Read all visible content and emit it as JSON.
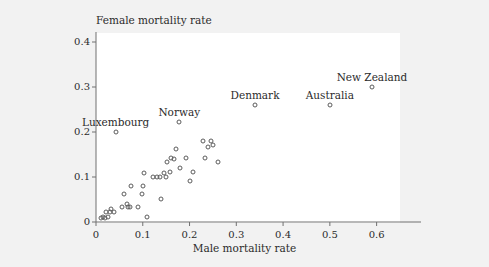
{
  "chart_data": {
    "type": "scatter",
    "title": "",
    "xlabel": "Male mortality rate",
    "ylabel": "Female mortality rate",
    "xlim": [
      0,
      0.65
    ],
    "ylim": [
      0,
      0.42
    ],
    "xticks": [
      "0",
      "0.1",
      "0.2",
      "0.3",
      "0.4",
      "0.5",
      "0.6"
    ],
    "xtick_values": [
      0,
      0.1,
      0.2,
      0.3,
      0.4,
      0.5,
      0.6
    ],
    "yticks": [
      "0",
      "0.1",
      "0.2",
      "0.3",
      "0.4"
    ],
    "ytick_values": [
      0,
      0.1,
      0.2,
      0.3,
      0.4
    ],
    "grid": false,
    "legend": null,
    "marker": "open-circle",
    "marker_color": "#5c5c5c",
    "panel_color": "#ffffff",
    "figure_color": "#f2f2f2",
    "points": [
      {
        "x": 0.01,
        "y": 0.01,
        "label": null
      },
      {
        "x": 0.015,
        "y": 0.012,
        "label": null
      },
      {
        "x": 0.02,
        "y": 0.01,
        "label": null
      },
      {
        "x": 0.022,
        "y": 0.022,
        "label": null
      },
      {
        "x": 0.026,
        "y": 0.012,
        "label": null
      },
      {
        "x": 0.03,
        "y": 0.022,
        "label": null
      },
      {
        "x": 0.032,
        "y": 0.03,
        "label": null
      },
      {
        "x": 0.038,
        "y": 0.022,
        "label": null
      },
      {
        "x": 0.042,
        "y": 0.2,
        "label": "Luxembourg"
      },
      {
        "x": 0.055,
        "y": 0.034,
        "label": null
      },
      {
        "x": 0.06,
        "y": 0.062,
        "label": null
      },
      {
        "x": 0.066,
        "y": 0.04,
        "label": null
      },
      {
        "x": 0.068,
        "y": 0.034,
        "label": null
      },
      {
        "x": 0.072,
        "y": 0.034,
        "label": null
      },
      {
        "x": 0.075,
        "y": 0.08,
        "label": null
      },
      {
        "x": 0.09,
        "y": 0.033,
        "label": null
      },
      {
        "x": 0.098,
        "y": 0.062,
        "label": null
      },
      {
        "x": 0.1,
        "y": 0.08,
        "label": null
      },
      {
        "x": 0.102,
        "y": 0.11,
        "label": null
      },
      {
        "x": 0.11,
        "y": 0.012,
        "label": null
      },
      {
        "x": 0.122,
        "y": 0.1,
        "label": null
      },
      {
        "x": 0.13,
        "y": 0.1,
        "label": null
      },
      {
        "x": 0.136,
        "y": 0.1,
        "label": null
      },
      {
        "x": 0.138,
        "y": 0.052,
        "label": null
      },
      {
        "x": 0.146,
        "y": 0.11,
        "label": null
      },
      {
        "x": 0.15,
        "y": 0.1,
        "label": null
      },
      {
        "x": 0.152,
        "y": 0.133,
        "label": null
      },
      {
        "x": 0.158,
        "y": 0.112,
        "label": null
      },
      {
        "x": 0.16,
        "y": 0.142,
        "label": null
      },
      {
        "x": 0.166,
        "y": 0.14,
        "label": null
      },
      {
        "x": 0.172,
        "y": 0.163,
        "label": null
      },
      {
        "x": 0.178,
        "y": 0.222,
        "label": "Norway"
      },
      {
        "x": 0.18,
        "y": 0.121,
        "label": null
      },
      {
        "x": 0.192,
        "y": 0.142,
        "label": null
      },
      {
        "x": 0.2,
        "y": 0.091,
        "label": null
      },
      {
        "x": 0.208,
        "y": 0.111,
        "label": null
      },
      {
        "x": 0.228,
        "y": 0.181,
        "label": null
      },
      {
        "x": 0.232,
        "y": 0.143,
        "label": null
      },
      {
        "x": 0.24,
        "y": 0.166,
        "label": null
      },
      {
        "x": 0.246,
        "y": 0.181,
        "label": null
      },
      {
        "x": 0.25,
        "y": 0.172,
        "label": null
      },
      {
        "x": 0.26,
        "y": 0.133,
        "label": null
      },
      {
        "x": 0.34,
        "y": 0.26,
        "label": "Denmark"
      },
      {
        "x": 0.5,
        "y": 0.26,
        "label": "Australia"
      },
      {
        "x": 0.59,
        "y": 0.301,
        "label": "New Zealand"
      }
    ],
    "annotations": [
      {
        "text": "Luxembourg",
        "x": 0.042,
        "y": 0.2
      },
      {
        "text": "Norway",
        "x": 0.178,
        "y": 0.222
      },
      {
        "text": "Denmark",
        "x": 0.34,
        "y": 0.26
      },
      {
        "text": "Australia",
        "x": 0.5,
        "y": 0.26
      },
      {
        "text": "New Zealand",
        "x": 0.59,
        "y": 0.301
      }
    ]
  }
}
